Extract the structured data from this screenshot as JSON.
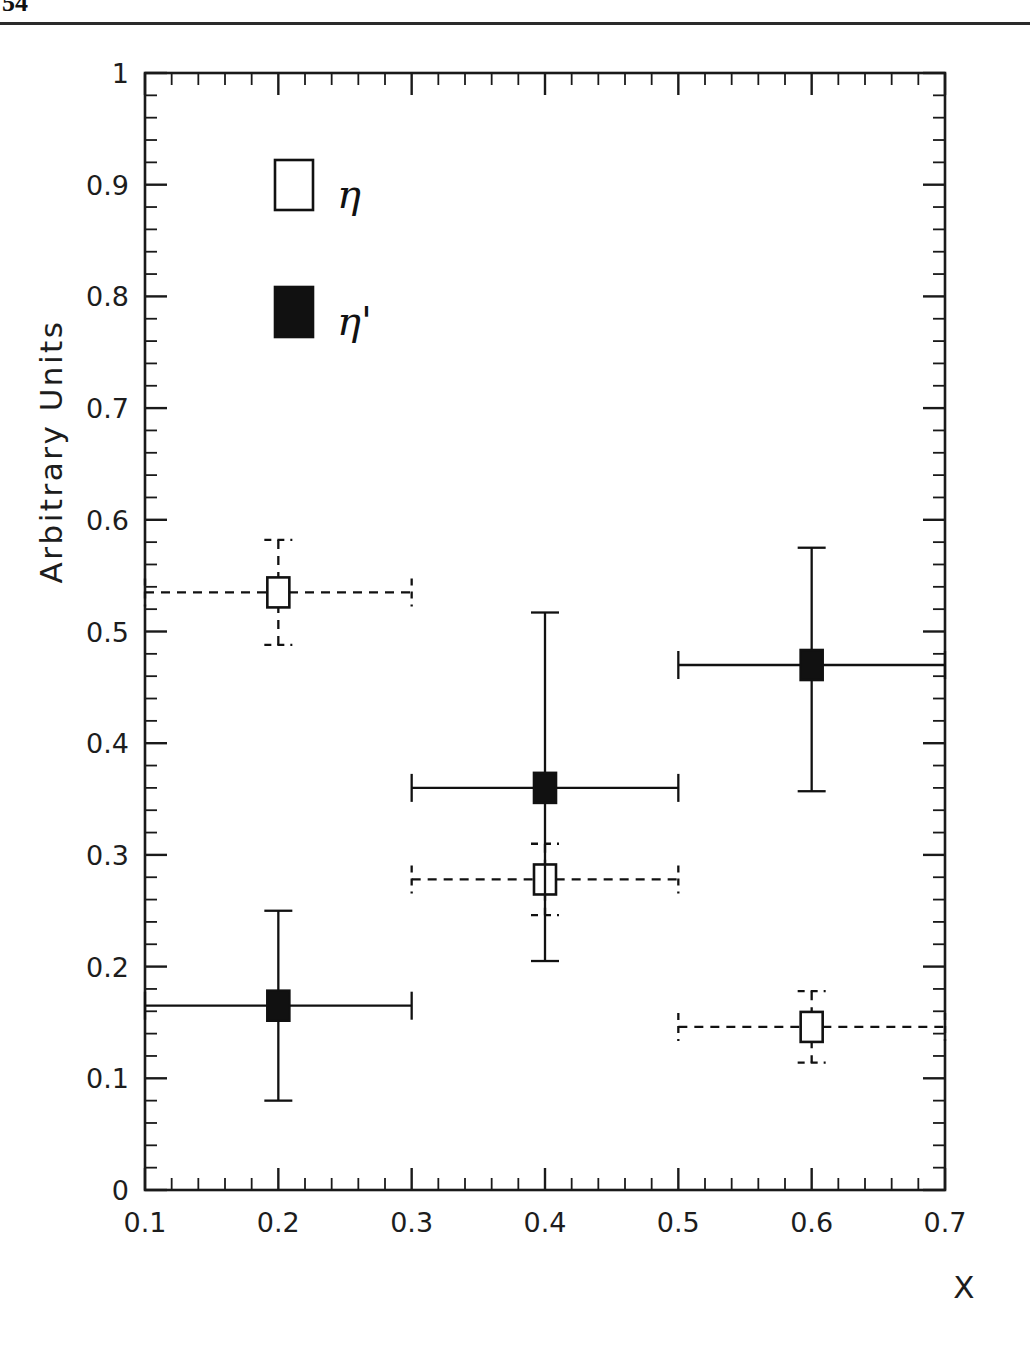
{
  "page": {
    "page_number": "54"
  },
  "chart_data": {
    "type": "scatter",
    "title": "",
    "xlabel": "X",
    "ylabel": "Arbitrary Units",
    "xlim": [
      0.1,
      0.7
    ],
    "ylim": [
      0.0,
      1.0
    ],
    "x_ticks": [
      "0.1",
      "0.2",
      "0.3",
      "0.4",
      "0.5",
      "0.6",
      "0.7"
    ],
    "x_tick_values": [
      0.1,
      0.2,
      0.3,
      0.4,
      0.5,
      0.6,
      0.7
    ],
    "y_ticks": [
      "0",
      "0.1",
      "0.2",
      "0.3",
      "0.4",
      "0.5",
      "0.6",
      "0.7",
      "0.8",
      "0.9",
      "1"
    ],
    "y_tick_values": [
      0.0,
      0.1,
      0.2,
      0.3,
      0.4,
      0.5,
      0.6,
      0.7,
      0.8,
      0.9,
      1.0
    ],
    "x_minor_step": 0.02,
    "y_minor_step": 0.02,
    "grid": false,
    "legend_position": "upper-left-inside",
    "series": [
      {
        "name": "eta",
        "label": "η",
        "marker": "open-square",
        "errorbar_style": "dashed",
        "color": "#111111",
        "points": [
          {
            "x": 0.2,
            "y": 0.535,
            "xerr": 0.1,
            "yerr_up": 0.047,
            "yerr_dn": 0.047
          },
          {
            "x": 0.4,
            "y": 0.278,
            "xerr": 0.1,
            "yerr_up": 0.032,
            "yerr_dn": 0.032
          },
          {
            "x": 0.6,
            "y": 0.146,
            "xerr": 0.1,
            "yerr_up": 0.032,
            "yerr_dn": 0.032
          }
        ]
      },
      {
        "name": "eta-prime",
        "label": "η'",
        "marker": "filled-square",
        "errorbar_style": "solid",
        "color": "#111111",
        "points": [
          {
            "x": 0.2,
            "y": 0.165,
            "xerr": 0.1,
            "yerr_up": 0.085,
            "yerr_dn": 0.085
          },
          {
            "x": 0.4,
            "y": 0.36,
            "xerr": 0.1,
            "yerr_up": 0.157,
            "yerr_dn": 0.155
          },
          {
            "x": 0.6,
            "y": 0.47,
            "xerr": 0.1,
            "yerr_up": 0.105,
            "yerr_dn": 0.113
          }
        ]
      }
    ],
    "legend": [
      {
        "label": "η",
        "marker": "open-square"
      },
      {
        "label": "η'",
        "marker": "filled-square"
      }
    ]
  }
}
